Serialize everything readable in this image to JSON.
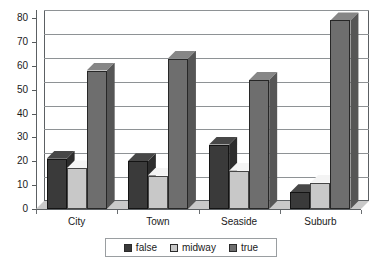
{
  "chart_data": {
    "type": "bar",
    "title": "",
    "subtitle": "",
    "xlabel": "",
    "ylabel": "",
    "categories": [
      "City",
      "Town",
      "Seaside",
      "Suburb"
    ],
    "series": [
      {
        "name": "false",
        "values": [
          21,
          20,
          27,
          7
        ],
        "color": "#3a3a3a"
      },
      {
        "name": "midway",
        "values": [
          17,
          14,
          16,
          11
        ],
        "color": "#c8c8c8"
      },
      {
        "name": "true",
        "values": [
          58,
          63,
          54,
          79
        ],
        "color": "#6e6e6e"
      }
    ],
    "ylim": [
      0,
      80
    ],
    "yticks": [
      0,
      10,
      20,
      30,
      40,
      50,
      60,
      70,
      80
    ],
    "grid": true,
    "legend_position": "bottom",
    "style": "3d-column"
  },
  "legend": {
    "items": [
      {
        "label": "false"
      },
      {
        "label": "midway"
      },
      {
        "label": "true"
      }
    ]
  }
}
